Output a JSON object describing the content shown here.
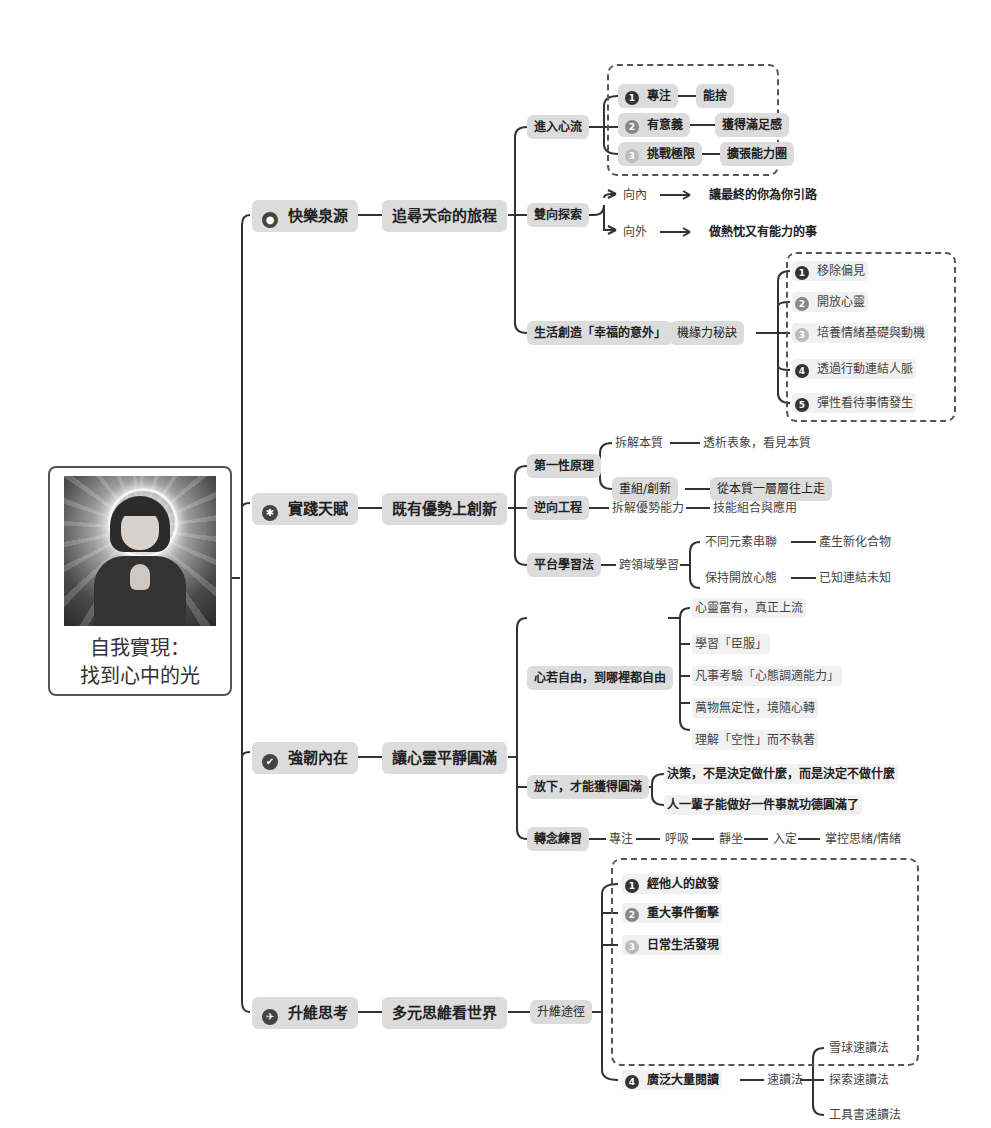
{
  "mindmap": {
    "center": {
      "title_line1": "自我實現：",
      "title_line2": "找到心中的光",
      "image": "praying-girl-with-halo"
    },
    "branches": [
      {
        "icon": "person-icon",
        "label": "快樂泉源",
        "sub": "追尋天命的旅程",
        "children": [
          {
            "label": "進入心流",
            "items": [
              {
                "num": "1",
                "label": "專注",
                "next": "能捨"
              },
              {
                "num": "2",
                "label": "有意義",
                "next": "獲得滿足感"
              },
              {
                "num": "3",
                "label": "挑戰極限",
                "next": "擴張能力圈"
              }
            ]
          },
          {
            "label": "雙向探索",
            "items": [
              {
                "label": "向內",
                "next": "讓最終的你為你引路"
              },
              {
                "label": "向外",
                "next": "做熱忱又有能力的事"
              }
            ]
          },
          {
            "label": "生活創造「幸福的意外」",
            "next": "機緣力秘訣",
            "items": [
              {
                "num": "1",
                "label": "移除偏見"
              },
              {
                "num": "2",
                "label": "開放心靈"
              },
              {
                "num": "3",
                "label": "培養情緒基礎與動機"
              },
              {
                "num": "4",
                "label": "透過行動連結人脈"
              },
              {
                "num": "5",
                "label": "彈性看待事情發生"
              }
            ]
          }
        ]
      },
      {
        "icon": "running-icon",
        "label": "實踐天賦",
        "sub": "既有優勢上創新",
        "children": [
          {
            "label": "第一性原理",
            "items": [
              {
                "label": "拆解本質",
                "next": "透析表象，看見本質"
              },
              {
                "label": "重組/創新",
                "next": "從本質一層層往上走"
              }
            ]
          },
          {
            "label": "逆向工程",
            "items": [
              {
                "label": "拆解優勢能力",
                "next": "技能組合與應用"
              }
            ]
          },
          {
            "label": "平台學習法",
            "next": "跨領域學習",
            "items": [
              {
                "label": "不同元素串聯",
                "next": "產生新化合物"
              },
              {
                "label": "保持開放心態",
                "next": "已知連結未知"
              }
            ]
          }
        ]
      },
      {
        "icon": "thumbs-up-icon",
        "label": "強韌內在",
        "sub": "讓心靈平靜圓滿",
        "children": [
          {
            "label": "心若自由，到哪裡都自由",
            "items": [
              {
                "label": "心靈富有，真正上流"
              },
              {
                "label": "學習「臣服」"
              },
              {
                "label": "凡事考驗「心態調適能力」"
              },
              {
                "label": "萬物無定性，境隨心轉"
              },
              {
                "label": "理解「空性」而不執著"
              }
            ]
          },
          {
            "label": "放下，才能獲得圓滿",
            "items": [
              {
                "label": "決策，不是決定做什麼，而是決定不做什麼"
              },
              {
                "label": "人一輩子能做好一件事就功德圓滿了"
              }
            ]
          },
          {
            "label": "轉念練習",
            "chain": [
              "專注",
              "呼吸",
              "靜坐",
              "入定",
              "掌控思緒/情緒"
            ]
          }
        ]
      },
      {
        "icon": "airplane-icon",
        "label": "升維思考",
        "sub": "多元思維看世界",
        "children": [
          {
            "label": "升維途徑",
            "items": [
              {
                "num": "1",
                "label": "經他人的啟發"
              },
              {
                "num": "2",
                "label": "重大事件衝擊"
              },
              {
                "num": "3",
                "label": "日常生活發現"
              },
              {
                "num": "4",
                "label": "廣泛大量閱讀",
                "next": "速讀法",
                "subitems": [
                  "雪球速讀法",
                  "探索速讀法",
                  "工具書速讀法"
                ]
              }
            ]
          }
        ]
      }
    ]
  },
  "icons": {
    "person-icon": "●",
    "running-icon": "✱",
    "thumbs-up-icon": "✔",
    "airplane-icon": "✈"
  },
  "colors": {
    "line": "#333333",
    "pill": "#dcdcdc",
    "pill_soft": "#f1f1f1",
    "border": "#555555"
  }
}
